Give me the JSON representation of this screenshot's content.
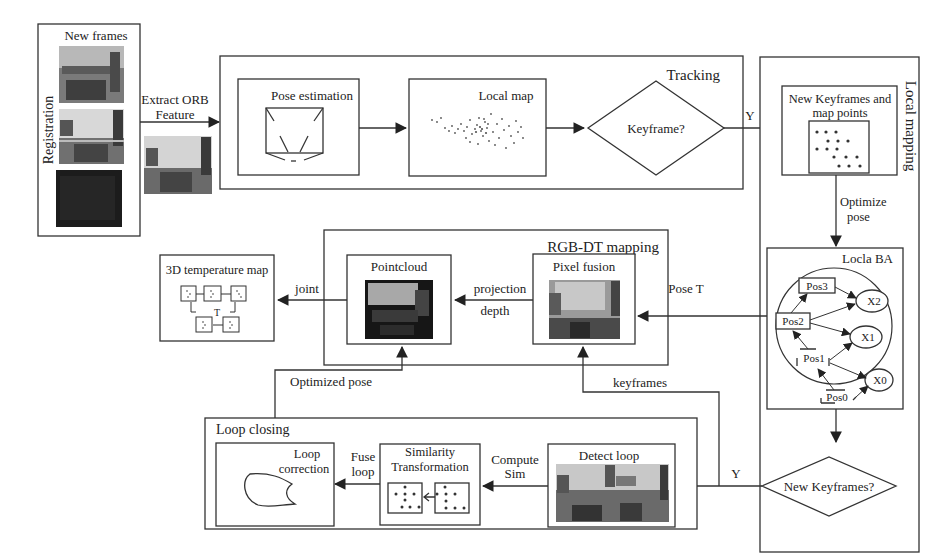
{
  "diagram": {
    "registration": {
      "side_label": "Registration",
      "title": "New frames"
    },
    "extract_edge": {
      "line1": "Extract ORB",
      "line2": "Feature"
    },
    "tracking": {
      "title": "Tracking",
      "pose_estimation": "Pose estimation",
      "local_map": "Local map",
      "keyframe_decision": "Keyframe?",
      "yes_label": "Y"
    },
    "local_mapping": {
      "title": "Local mapping",
      "new_keyframes": {
        "line1": "New Keyframes and",
        "line2": "map points"
      },
      "optimize_edge": {
        "line1": "Optimize",
        "line2": "pose"
      },
      "local_ba": {
        "title": "Locla BA",
        "poses": [
          "Pos3",
          "Pos2",
          "Pos1",
          "Pos0"
        ],
        "points": [
          "X2",
          "X1",
          "X0"
        ]
      },
      "new_keyframes_decision": "New Keyframes?",
      "yes_label": "Y"
    },
    "rgbdt_mapping": {
      "title": "RGB-DT mapping",
      "pixel_fusion": "Pixel fusion",
      "pointcloud": "Pointcloud",
      "projection_edge": {
        "line1": "projection",
        "line2": "depth"
      },
      "pose_edge": "Pose T"
    },
    "temperature_map": {
      "title": "3D temperature map",
      "joint_edge": "joint",
      "center_label": "T"
    },
    "edges": {
      "optimized_pose": "Optimized pose",
      "keyframes": "keyframes"
    },
    "loop_closing": {
      "title": "Loop closing",
      "detect_loop": "Detect loop",
      "compute_edge": {
        "line1": "Compute",
        "line2": "Sim"
      },
      "similarity": {
        "line1": "Similarity",
        "line2": "Transformation"
      },
      "fuse_edge": {
        "line1": "Fuse",
        "line2": "loop"
      },
      "loop_correction": {
        "line1": "Loop",
        "line2": "correction"
      }
    }
  }
}
